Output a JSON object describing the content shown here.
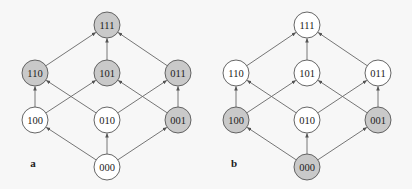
{
  "colors": {
    "background": "#f7f7f7",
    "node_stroke": "#555555",
    "node_fill_plain": "#ffffff",
    "node_fill_highlight": "#c9c9c9",
    "edge": "#666666"
  },
  "node_radius": 13,
  "edges": [
    [
      "000",
      "100"
    ],
    [
      "000",
      "010"
    ],
    [
      "000",
      "001"
    ],
    [
      "100",
      "110"
    ],
    [
      "100",
      "101"
    ],
    [
      "010",
      "110"
    ],
    [
      "010",
      "011"
    ],
    [
      "001",
      "101"
    ],
    [
      "001",
      "011"
    ],
    [
      "110",
      "111"
    ],
    [
      "101",
      "111"
    ],
    [
      "011",
      "111"
    ]
  ],
  "panels": [
    {
      "label": "a",
      "label_pos": [
        33,
        167
      ],
      "nodes": [
        {
          "id": "111",
          "x": 107,
          "y": 25,
          "highlighted": true
        },
        {
          "id": "110",
          "x": 35,
          "y": 73,
          "highlighted": true
        },
        {
          "id": "101",
          "x": 107,
          "y": 73,
          "highlighted": true
        },
        {
          "id": "011",
          "x": 178,
          "y": 73,
          "highlighted": true
        },
        {
          "id": "100",
          "x": 35,
          "y": 120,
          "highlighted": false
        },
        {
          "id": "010",
          "x": 107,
          "y": 120,
          "highlighted": false
        },
        {
          "id": "001",
          "x": 178,
          "y": 120,
          "highlighted": true
        },
        {
          "id": "000",
          "x": 107,
          "y": 167,
          "highlighted": false
        }
      ]
    },
    {
      "label": "b",
      "label_pos": [
        234,
        167
      ],
      "nodes": [
        {
          "id": "111",
          "x": 307,
          "y": 25,
          "highlighted": false
        },
        {
          "id": "110",
          "x": 236,
          "y": 73,
          "highlighted": false
        },
        {
          "id": "101",
          "x": 307,
          "y": 73,
          "highlighted": false
        },
        {
          "id": "011",
          "x": 378,
          "y": 73,
          "highlighted": false
        },
        {
          "id": "100",
          "x": 236,
          "y": 120,
          "highlighted": true
        },
        {
          "id": "010",
          "x": 307,
          "y": 120,
          "highlighted": false
        },
        {
          "id": "001",
          "x": 378,
          "y": 120,
          "highlighted": true
        },
        {
          "id": "000",
          "x": 307,
          "y": 167,
          "highlighted": true
        }
      ]
    }
  ]
}
